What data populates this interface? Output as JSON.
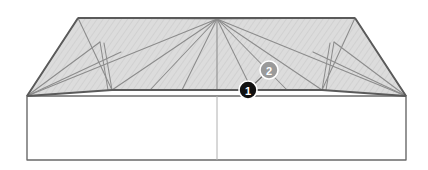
{
  "diagram": {
    "type": "architectural-roof-plan",
    "background_color": "#ffffff",
    "roof_fill_color": "#dcdcdc",
    "outline_color": "#555555",
    "hatch_color": "#b5b5b5",
    "wall_line_color": "#666666",
    "center_line_color": "#aaaaaa"
  },
  "geometry": {
    "apex": {
      "x": 217,
      "y": 19
    },
    "ridge_left": {
      "x": 78,
      "y": 18
    },
    "ridge_right": {
      "x": 355,
      "y": 18
    },
    "eave_left": {
      "x": 27,
      "y": 96
    },
    "eave_right": {
      "x": 406,
      "y": 96
    },
    "valley_left": {
      "x": 112,
      "y": 90
    },
    "valley_right": {
      "x": 322,
      "y": 90
    },
    "wall_bottom_left": {
      "x": 27,
      "y": 160
    },
    "wall_bottom_right": {
      "x": 406,
      "y": 160
    },
    "center_line_x": 217
  },
  "callouts": [
    {
      "id": "callout-1",
      "label": "1",
      "x": 248,
      "y": 90,
      "radius": 9,
      "fill": "#111111",
      "text_color": "#ffffff"
    },
    {
      "id": "callout-2",
      "label": "2",
      "x": 269,
      "y": 70,
      "radius": 9,
      "fill": "#9a9a9a",
      "text_color": "#ffffff"
    }
  ],
  "leader_line": {
    "from": {
      "x": 248,
      "y": 90
    },
    "to": {
      "x": 269,
      "y": 70
    }
  }
}
